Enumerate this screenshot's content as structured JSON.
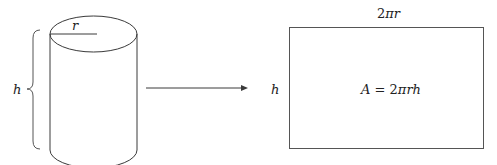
{
  "diagram": {
    "cylinder": {
      "radius_label": "r",
      "height_label": "h"
    },
    "arrow": {
      "direction": "right"
    },
    "rectangle": {
      "top_label_num": "2",
      "top_label_pi": "π",
      "top_label_var": "r",
      "side_label": "h",
      "area_lhs": "A",
      "area_eq": " = ",
      "area_num": "2",
      "area_rest": "πrh"
    },
    "colors": {
      "stroke": "#3a3a3a",
      "text": "#222222",
      "background": "#ffffff"
    }
  }
}
